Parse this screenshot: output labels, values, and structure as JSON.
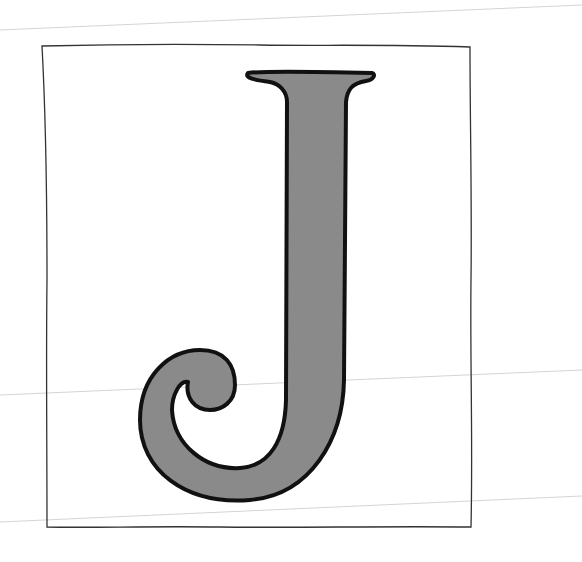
{
  "illustration": {
    "subject": "letter J",
    "letter": "J",
    "colors": {
      "background": "#ffffff",
      "letter_fill": "#8a8a8a",
      "letter_outline": "#111111",
      "frame_stroke": "#333333",
      "guide_lines": "#d0d0d0"
    }
  }
}
